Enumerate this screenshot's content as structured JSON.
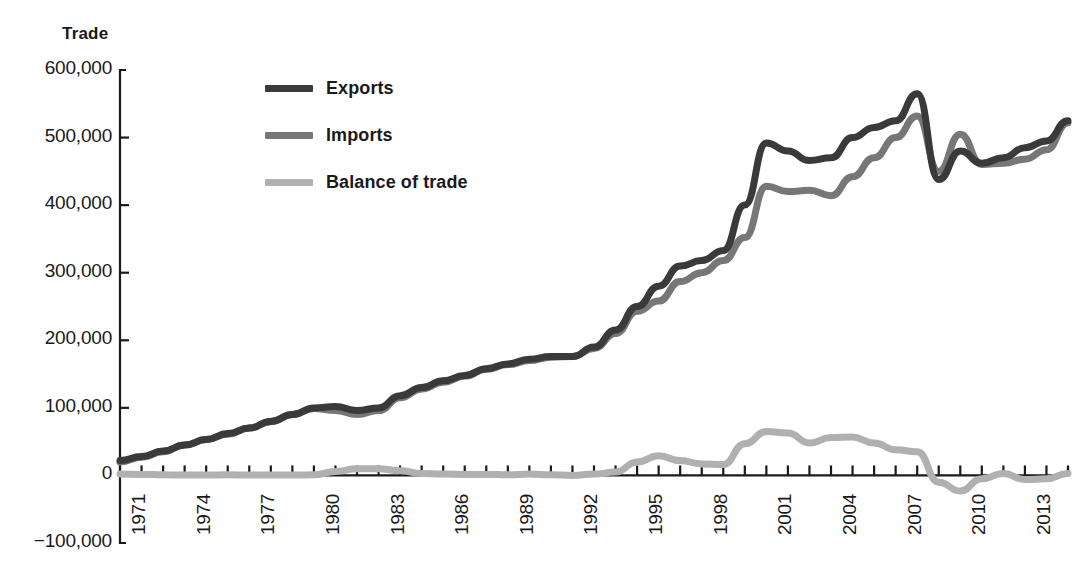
{
  "chart_data": {
    "type": "line",
    "title": "",
    "ylabel": "Trade",
    "xlabel": "",
    "ylim": [
      -100000,
      600000
    ],
    "xlim": [
      1971,
      2015
    ],
    "grid": false,
    "legend_position": "upper-left-inside",
    "y_ticks": [
      600000,
      500000,
      400000,
      300000,
      200000,
      100000,
      0,
      -100000
    ],
    "y_tick_labels": [
      "600,000",
      "500,000",
      "400,000",
      "300,000",
      "200,000",
      "100,000",
      "0",
      "-100,000"
    ],
    "x_tick_labels": [
      "1971",
      "1974",
      "1977",
      "1980",
      "1983",
      "1986",
      "1989",
      "1992",
      "1995",
      "1998",
      "2001",
      "2004",
      "2007",
      "2010",
      "2013"
    ],
    "x": [
      1971,
      1972,
      1973,
      1974,
      1975,
      1976,
      1977,
      1978,
      1979,
      1980,
      1981,
      1982,
      1983,
      1984,
      1985,
      1986,
      1987,
      1988,
      1989,
      1990,
      1991,
      1992,
      1993,
      1994,
      1995,
      1996,
      1997,
      1998,
      1999,
      2000,
      2001,
      2002,
      2003,
      2004,
      2005,
      2006,
      2007,
      2008,
      2009,
      2010,
      2011,
      2012,
      2013,
      2014,
      2015
    ],
    "series": [
      {
        "name": "Exports",
        "color": "#3a3a3a",
        "values": [
          22000,
          28000,
          36000,
          45000,
          53000,
          62000,
          70000,
          80000,
          90000,
          100000,
          102000,
          96000,
          100000,
          118000,
          130000,
          140000,
          148000,
          158000,
          165000,
          172000,
          176000,
          176000,
          190000,
          215000,
          250000,
          280000,
          310000,
          318000,
          333000,
          400000,
          492000,
          480000,
          466000,
          470000,
          500000,
          515000,
          525000,
          565000,
          438000,
          480000,
          462000,
          470000,
          485000,
          495000,
          525000
        ]
      },
      {
        "name": "Imports",
        "color": "#777777",
        "values": [
          20000,
          27000,
          35000,
          45000,
          53000,
          61000,
          70000,
          80000,
          90000,
          99000,
          96000,
          90000,
          96000,
          115000,
          128000,
          138000,
          147000,
          157000,
          164000,
          170000,
          175000,
          176000,
          188000,
          210000,
          243000,
          258000,
          287000,
          300000,
          318000,
          352000,
          428000,
          420000,
          422000,
          414000,
          442000,
          470000,
          500000,
          532000,
          450000,
          505000,
          460000,
          462000,
          468000,
          482000,
          522000
        ]
      },
      {
        "name": "Balance of trade",
        "color": "#b0b0b0",
        "values": [
          2000,
          1500,
          1000,
          500,
          500,
          1000,
          500,
          500,
          500,
          1000,
          6000,
          10000,
          10000,
          7000,
          3000,
          2000,
          1500,
          1500,
          1000,
          2000,
          1000,
          0,
          2000,
          5000,
          20000,
          29000,
          22000,
          17000,
          16000,
          47000,
          65000,
          63000,
          48000,
          56000,
          57000,
          48000,
          38000,
          35000,
          -10000,
          -23000,
          -5000,
          3000,
          -6000,
          -5000,
          3000
        ]
      }
    ]
  },
  "legend": {
    "items": [
      {
        "label": "Exports",
        "color": "#3a3a3a"
      },
      {
        "label": "Imports",
        "color": "#777777"
      },
      {
        "label": "Balance of trade",
        "color": "#b0b0b0"
      }
    ]
  },
  "axes": {
    "y_title": "Trade"
  }
}
